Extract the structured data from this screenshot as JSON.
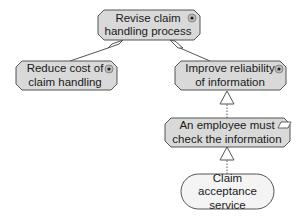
{
  "diagram": {
    "type": "ArchiMate motivation view",
    "colors": {
      "goal_fill": "#d9d9d9",
      "requirement_fill": "#d9d9d9",
      "service_fill": "#f4f4f4",
      "stroke": "#555555"
    },
    "nodes": [
      {
        "id": "revise",
        "kind": "goal",
        "line1": "Revise claim",
        "line2": "handling process",
        "icon": "goal-target-icon"
      },
      {
        "id": "reduce",
        "kind": "goal",
        "line1": "Reduce cost of",
        "line2": "claim handling",
        "icon": "goal-target-icon"
      },
      {
        "id": "improve",
        "kind": "goal",
        "line1": "Improve reliability",
        "line2": "of information",
        "icon": "goal-target-icon"
      },
      {
        "id": "employee",
        "kind": "requirement",
        "line1": "An employee must",
        "line2": "check the information",
        "icon": "requirement-parallelogram-icon"
      },
      {
        "id": "service",
        "kind": "business-service",
        "line1": "Claim",
        "line2": "acceptance service",
        "icon": ""
      }
    ],
    "edges": [
      {
        "from": "reduce",
        "to": "revise",
        "type": "aggregation"
      },
      {
        "from": "improve",
        "to": "revise",
        "type": "aggregation"
      },
      {
        "from": "employee",
        "to": "improve",
        "type": "realization"
      },
      {
        "from": "service",
        "to": "employee",
        "type": "realization"
      }
    ]
  }
}
